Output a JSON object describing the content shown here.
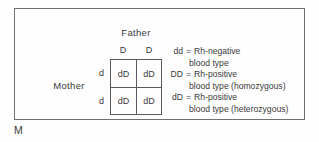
{
  "figure": {
    "label": "M"
  },
  "punnett": {
    "father_label": "Father",
    "mother_label": "Mother",
    "father_alleles": [
      "D",
      "D"
    ],
    "mother_alleles": [
      "d",
      "d"
    ],
    "cells": [
      [
        "dD",
        "dD"
      ],
      [
        "dD",
        "dD"
      ]
    ]
  },
  "legend": {
    "entries": [
      {
        "genotype": "dd",
        "equals": "=",
        "phenotype": "Rh-negative",
        "detail": "blood type"
      },
      {
        "genotype": "DD",
        "equals": "=",
        "phenotype": "Rh-positive",
        "detail": "blood type (homozygous)"
      },
      {
        "genotype": "dD",
        "equals": "=",
        "phenotype": "Rh-positive",
        "detail": "blood type (heterozygous)"
      }
    ]
  },
  "colors": {
    "background": "#fefefe",
    "line": "#6f6f6f",
    "grid_line": "#5a5a5a",
    "text": "#3a3a3a"
  }
}
